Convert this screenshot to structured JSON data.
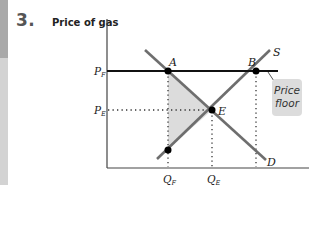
{
  "question_number": "3.",
  "axes": {
    "y_label": "Price of gas",
    "x_label": ""
  },
  "price_labels": {
    "floor": {
      "main": "P",
      "sub": "F"
    },
    "equilibrium": {
      "main": "P",
      "sub": "E"
    }
  },
  "quantity_labels": {
    "floor": {
      "main": "Q",
      "sub": "F"
    },
    "equilibrium": {
      "main": "Q",
      "sub": "E"
    }
  },
  "points": {
    "a": "A",
    "b": "B",
    "e": "E"
  },
  "curves": {
    "supply": "S",
    "demand": "D"
  },
  "annotation": {
    "line1": "Price",
    "line2": "floor"
  },
  "colors": {
    "curve": "#6e6e6e",
    "floor_line": "#111111",
    "shade": "#dcdcdc",
    "axis": "#444444"
  }
}
